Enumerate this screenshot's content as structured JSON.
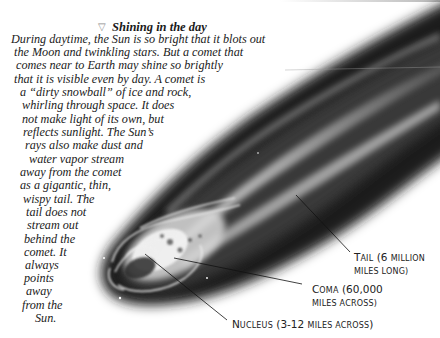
{
  "section": {
    "heading_icon": "triangle-down-icon",
    "heading": "Shining in the day",
    "body_lines": [
      "During daytime, the Sun is so bright that it blots out",
      "the Moon and twinkling stars. But a comet that",
      "comes near to Earth may shine so brightly",
      "that it is visible even by day. A comet is",
      "a “dirty snowball” of ice and rock,",
      "whirling through space. It does",
      "not make light of its own, but",
      "reflects sunlight. The Sun’s",
      "rays also make dust and",
      "water vapor stream",
      "away from the comet",
      "as a gigantic, thin,",
      "wispy tail. The",
      "tail does not",
      "stream out",
      "behind the",
      "comet. It",
      "always",
      "points",
      "away",
      "from the",
      "Sun."
    ]
  },
  "illustration": {
    "subject": "comet",
    "colors": {
      "dark": "#1c1c1c",
      "mid": "#6e6e6e",
      "bright": "#f2f2f2",
      "background": "#ffffff"
    }
  },
  "labels": {
    "tail": {
      "big": "T",
      "small1": "AIL",
      "rest1": " (6 ",
      "small2": "MILLION",
      "line2": "MILES LONG)"
    },
    "coma": {
      "big": "C",
      "small1": "OMA",
      "rest1": " (60,000",
      "line2": "MILES ACROSS)"
    },
    "nucleus": {
      "big": "N",
      "small1": "UCLEUS",
      "rest1": " (3-12 ",
      "small2": "MILES ACROSS",
      "rest2": ")"
    }
  }
}
